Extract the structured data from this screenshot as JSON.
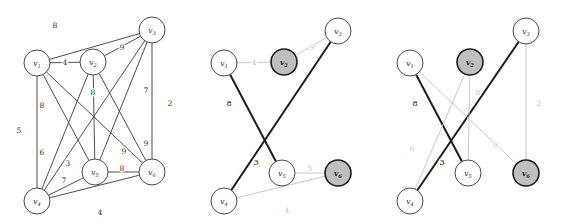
{
  "figure": {
    "kind": "weighted-graph-triptych",
    "panel_count": 3,
    "colors": {
      "node_fill": "#ffffff",
      "node_fill_shaded": "#bfbfbf",
      "node_stroke": "#4a4a4a",
      "edge_dark": "#3a3a3a",
      "edge_bold": "#1d1d1d",
      "edge_light": "#c2c2c2",
      "background": "#ffffff"
    }
  },
  "panels": [
    {
      "id": "panel-left",
      "name": "complete-weighted-graph",
      "nodes": [
        {
          "id": "v1",
          "label": "v",
          "sub": "1",
          "x": 37,
          "y": 63,
          "r": 13,
          "shaded": false,
          "bold": false
        },
        {
          "id": "v2",
          "label": "v",
          "sub": "2",
          "x": 93,
          "y": 62,
          "r": 13,
          "shaded": false,
          "bold": false
        },
        {
          "id": "v3",
          "label": "v",
          "sub": "3",
          "x": 152,
          "y": 30,
          "r": 13,
          "shaded": false,
          "bold": false
        },
        {
          "id": "v4",
          "label": "v",
          "sub": "4",
          "x": 37,
          "y": 201,
          "r": 13,
          "shaded": false,
          "bold": false
        },
        {
          "id": "v5",
          "label": "v",
          "sub": "5",
          "x": 95,
          "y": 172,
          "r": 13,
          "shaded": false,
          "bold": false
        },
        {
          "id": "v6",
          "label": "v",
          "sub": "6",
          "x": 152,
          "y": 172,
          "r": 13,
          "shaded": false,
          "bold": false
        }
      ],
      "edges": [
        {
          "from": "v1",
          "to": "v3",
          "weight": "8",
          "style": "dark",
          "lx": 55,
          "ly": 25
        },
        {
          "from": "v1",
          "to": "v2",
          "weight": "4",
          "style": "dark",
          "lx": 65,
          "ly": 62
        },
        {
          "from": "v2",
          "to": "v3",
          "weight": "9",
          "style": "dark",
          "lx": 122,
          "ly": 47
        },
        {
          "from": "v1",
          "to": "v4",
          "weight": "5",
          "style": "dark",
          "lx": 19,
          "ly": 130
        },
        {
          "from": "v1",
          "to": "v5",
          "weight": "8",
          "style": "dark",
          "lx": 42,
          "ly": 105
        },
        {
          "from": "v1",
          "to": "v6",
          "weight": "6",
          "style": "dark",
          "lx": 42,
          "ly": 152
        },
        {
          "from": "v2",
          "to": "v5",
          "weight": "8",
          "style": "dark",
          "lx": 93,
          "ly": 92
        },
        {
          "from": "v2",
          "to": "v4",
          "weight": "3",
          "style": "dark",
          "lx": 68,
          "ly": 163
        },
        {
          "from": "v2",
          "to": "v6",
          "weight": "9",
          "style": "dark",
          "lx": 124,
          "ly": 151
        },
        {
          "from": "v3",
          "to": "v5",
          "weight": "7",
          "style": "dark",
          "lx": 146,
          "ly": 90
        },
        {
          "from": "v3",
          "to": "v6",
          "weight": "2",
          "style": "dark",
          "lx": 170,
          "ly": 103
        },
        {
          "from": "v3",
          "to": "v4",
          "weight": "9",
          "style": "dark",
          "lx": 146,
          "ly": 143
        },
        {
          "from": "v4",
          "to": "v5",
          "weight": "7",
          "style": "dark",
          "lx": 64,
          "ly": 180
        },
        {
          "from": "v4",
          "to": "v6",
          "weight": "4",
          "style": "dark",
          "lx": 100,
          "ly": 212
        },
        {
          "from": "v5",
          "to": "v6",
          "weight": "8",
          "style": "dark",
          "lx": 122,
          "ly": 168
        }
      ]
    },
    {
      "id": "panel-middle",
      "name": "matching-step-one",
      "nodes": [
        {
          "id": "v1",
          "label": "v",
          "sub": "1",
          "x": 38,
          "y": 63,
          "r": 13,
          "shaded": false,
          "bold": false
        },
        {
          "id": "v2",
          "label": "v",
          "sub": "2",
          "x": 98,
          "y": 62,
          "r": 13,
          "shaded": true,
          "bold": true
        },
        {
          "id": "v3",
          "label": "v",
          "sub": "3",
          "x": 152,
          "y": 31,
          "r": 13,
          "shaded": false,
          "bold": false
        },
        {
          "id": "v4",
          "label": "v",
          "sub": "4",
          "x": 38,
          "y": 201,
          "r": 13,
          "shaded": false,
          "bold": false
        },
        {
          "id": "v5",
          "label": "v",
          "sub": "5",
          "x": 96,
          "y": 173,
          "r": 13,
          "shaded": false,
          "bold": false
        },
        {
          "id": "v6",
          "label": "v",
          "sub": "6",
          "x": 152,
          "y": 173,
          "r": 13,
          "shaded": true,
          "bold": true
        }
      ],
      "edges": [
        {
          "from": "v1",
          "to": "v2",
          "weight": "4",
          "style": "light",
          "lx": 68,
          "ly": 62
        },
        {
          "from": "v2",
          "to": "v3",
          "weight": "9",
          "style": "light",
          "lx": 126,
          "ly": 47
        },
        {
          "from": "v1",
          "to": "v5",
          "weight": "8",
          "style": "bold",
          "lx": 43,
          "ly": 103
        },
        {
          "from": "v4",
          "to": "v3",
          "weight": "3",
          "style": "bold",
          "lx": 70,
          "ly": 162
        },
        {
          "from": "v5",
          "to": "v6",
          "weight": "5",
          "style": "light",
          "lx": 124,
          "ly": 168
        },
        {
          "from": "v4",
          "to": "v6",
          "weight": "4",
          "style": "light",
          "lx": 101,
          "ly": 210
        }
      ]
    },
    {
      "id": "panel-right",
      "name": "matching-step-two",
      "nodes": [
        {
          "id": "v1",
          "label": "v",
          "sub": "1",
          "x": 38,
          "y": 63,
          "r": 13,
          "shaded": false,
          "bold": false
        },
        {
          "id": "v2",
          "label": "v",
          "sub": "2",
          "x": 98,
          "y": 62,
          "r": 13,
          "shaded": true,
          "bold": true
        },
        {
          "id": "v3",
          "label": "v",
          "sub": "3",
          "x": 154,
          "y": 31,
          "r": 13,
          "shaded": false,
          "bold": false
        },
        {
          "id": "v4",
          "label": "v",
          "sub": "4",
          "x": 38,
          "y": 201,
          "r": 13,
          "shaded": false,
          "bold": false
        },
        {
          "id": "v5",
          "label": "v",
          "sub": "5",
          "x": 96,
          "y": 173,
          "r": 13,
          "shaded": false,
          "bold": false
        },
        {
          "id": "v6",
          "label": "v",
          "sub": "6",
          "x": 154,
          "y": 173,
          "r": 13,
          "shaded": true,
          "bold": true
        }
      ],
      "edges": [
        {
          "from": "v1",
          "to": "v5",
          "weight": "8",
          "style": "bold",
          "lx": 43,
          "ly": 103
        },
        {
          "from": "v4",
          "to": "v3",
          "weight": "3",
          "style": "bold",
          "lx": 70,
          "ly": 162
        },
        {
          "from": "v2",
          "to": "v5",
          "weight": "8",
          "style": "light",
          "lx": 106,
          "ly": 92
        },
        {
          "from": "v1",
          "to": "v6",
          "weight": "9",
          "style": "light",
          "lx": 123,
          "ly": 145
        },
        {
          "from": "v2",
          "to": "v4",
          "weight": "6",
          "style": "light",
          "lx": 40,
          "ly": 148
        },
        {
          "from": "v3",
          "to": "v6",
          "weight": "2",
          "style": "light",
          "lx": 167,
          "ly": 103
        }
      ]
    }
  ]
}
